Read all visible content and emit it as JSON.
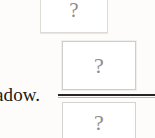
{
  "page": {
    "background_color": "#fdfcfa",
    "width": 155,
    "height": 138,
    "kind": "scanned-document-fragment"
  },
  "body_text": {
    "fragment": "adow.",
    "full_word_implied": "shadow.",
    "color": "#191817"
  },
  "rule": {
    "name": "horizontal-rule",
    "color": "#262524",
    "secondary_color": "#b9b7b4"
  },
  "placeholders": [
    {
      "id": "top",
      "glyph": "?",
      "label": "missing-image-placeholder",
      "glyph_color": "#8e8c8a",
      "border_color": "#dedbd6",
      "clipped": "top"
    },
    {
      "id": "middle",
      "glyph": "?",
      "label": "missing-image-placeholder",
      "glyph_color": "#8e8c8a",
      "border_color": "#cfcdc9",
      "clipped": "none"
    },
    {
      "id": "bottom",
      "glyph": "?",
      "label": "missing-image-placeholder",
      "glyph_color": "#8e8c8a",
      "border_color": "#d5d3cf",
      "clipped": "bottom"
    }
  ]
}
